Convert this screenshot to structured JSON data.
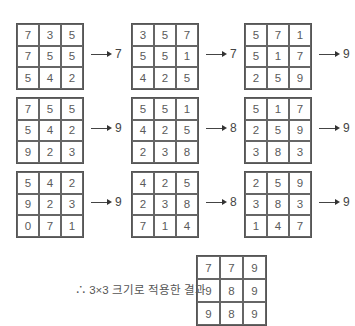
{
  "steps": [
    {
      "grid": [
        "7",
        "3",
        "5",
        "7",
        "5",
        "5",
        "5",
        "4",
        "2"
      ],
      "result": "7"
    },
    {
      "grid": [
        "3",
        "5",
        "7",
        "5",
        "5",
        "1",
        "4",
        "2",
        "5"
      ],
      "result": "7"
    },
    {
      "grid": [
        "5",
        "7",
        "1",
        "5",
        "1",
        "7",
        "2",
        "5",
        "9"
      ],
      "result": "9"
    },
    {
      "grid": [
        "7",
        "5",
        "5",
        "5",
        "4",
        "2",
        "9",
        "2",
        "3"
      ],
      "result": "9"
    },
    {
      "grid": [
        "5",
        "5",
        "1",
        "4",
        "2",
        "5",
        "2",
        "3",
        "8"
      ],
      "result": "8"
    },
    {
      "grid": [
        "5",
        "1",
        "7",
        "2",
        "5",
        "9",
        "3",
        "8",
        "3"
      ],
      "result": "9"
    },
    {
      "grid": [
        "5",
        "4",
        "2",
        "9",
        "2",
        "3",
        "0",
        "7",
        "1"
      ],
      "result": "9"
    },
    {
      "grid": [
        "4",
        "2",
        "5",
        "2",
        "3",
        "8",
        "7",
        "1",
        "4"
      ],
      "result": "8"
    },
    {
      "grid": [
        "2",
        "5",
        "9",
        "3",
        "8",
        "3",
        "1",
        "4",
        "7"
      ],
      "result": "9"
    }
  ],
  "caption": "∴ 3×3 크기로 적용한 결과",
  "result_grid": [
    "7",
    "7",
    "9",
    "9",
    "8",
    "9",
    "9",
    "8",
    "9"
  ],
  "layout": {
    "cols_x": [
      16,
      131,
      244
    ],
    "rows_y": [
      23,
      97,
      171
    ]
  }
}
